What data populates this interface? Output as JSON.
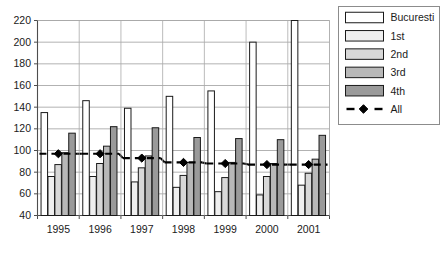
{
  "chart_data": {
    "type": "bar",
    "title": "",
    "subtitle": "",
    "xlabel": "",
    "ylabel": "",
    "categories": [
      "1995",
      "1996",
      "1997",
      "1998",
      "1999",
      "2000",
      "2001"
    ],
    "ylim": [
      40,
      220
    ],
    "ytick_step": 20,
    "yticks": [
      40,
      60,
      80,
      100,
      120,
      140,
      160,
      180,
      200,
      220
    ],
    "grid": "horizontal",
    "legend_position": "right-outside",
    "series": [
      {
        "name": "Bucuresti",
        "type": "bar",
        "fill": "#ffffff",
        "values": [
          135,
          146,
          139,
          150,
          155,
          200,
          220
        ]
      },
      {
        "name": "1st",
        "type": "bar",
        "fill": "#efefef",
        "values": [
          76,
          76,
          71,
          66,
          62,
          59,
          68
        ]
      },
      {
        "name": "2nd",
        "type": "bar",
        "fill": "#d8d8d8",
        "values": [
          87,
          88,
          84,
          77,
          75,
          76,
          79
        ]
      },
      {
        "name": "3rd",
        "type": "bar",
        "fill": "#b8b8b8",
        "values": [
          98,
          104,
          95,
          89,
          89,
          88,
          92
        ]
      },
      {
        "name": "4th",
        "type": "bar",
        "fill": "#9a9a9a",
        "values": [
          116,
          122,
          121,
          112,
          111,
          110,
          114
        ]
      },
      {
        "name": "All",
        "type": "line",
        "line_style": "dashed",
        "marker": "diamond",
        "color": "#000000",
        "values": [
          97,
          97,
          93,
          89,
          88,
          87,
          87
        ]
      }
    ]
  },
  "axes": {
    "ytick_labels": [
      "220",
      "200",
      "180",
      "160",
      "140",
      "120",
      "100",
      "80",
      "60",
      "40"
    ],
    "xtick_labels": [
      "1995",
      "1996",
      "1997",
      "1998",
      "1999",
      "2000",
      "2001"
    ]
  },
  "legend": {
    "entries": [
      {
        "label": "Bucuresti",
        "swatch": "#ffffff",
        "kind": "bar"
      },
      {
        "label": "1st",
        "swatch": "#efefef",
        "kind": "bar"
      },
      {
        "label": "2nd",
        "swatch": "#d8d8d8",
        "kind": "bar"
      },
      {
        "label": "3rd",
        "swatch": "#b8b8b8",
        "kind": "bar"
      },
      {
        "label": "4th",
        "swatch": "#9a9a9a",
        "kind": "bar"
      },
      {
        "label": "All",
        "swatch": "#000000",
        "kind": "line-marker"
      }
    ]
  },
  "colors": {
    "plot_border": "#808080",
    "grid": "#a9a9a9",
    "bar_stroke": "#1a1a1a",
    "text": "#1a1a1a",
    "background": "#ffffff"
  }
}
